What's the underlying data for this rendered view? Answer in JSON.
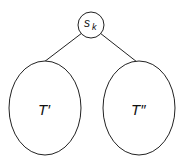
{
  "diagram": {
    "root": {
      "label": "s",
      "subscript": "k"
    },
    "left_subtree": {
      "label": "T′"
    },
    "right_subtree": {
      "label": "T″"
    },
    "stroke_color": "#222222"
  }
}
